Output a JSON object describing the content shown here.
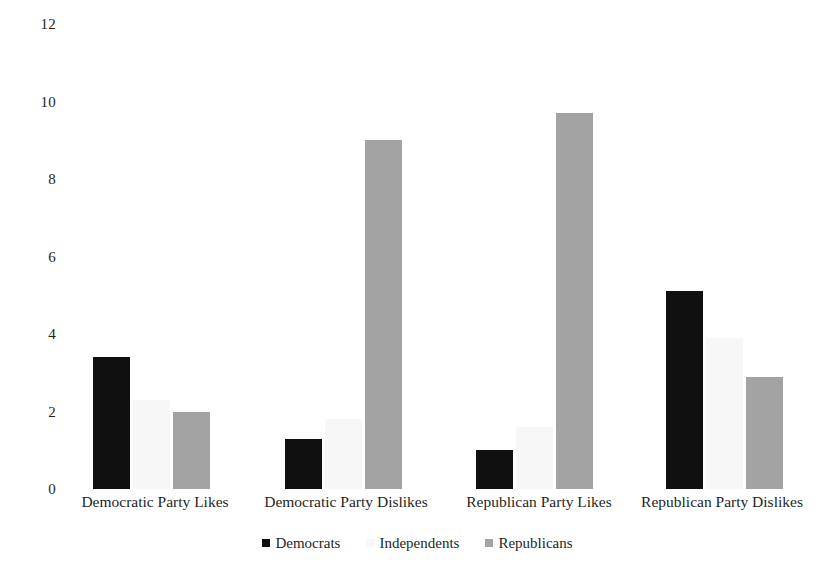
{
  "chart_data": {
    "type": "bar",
    "title": "",
    "subtitle": "",
    "xlabel": "",
    "ylabel": "",
    "ylim": [
      0,
      12
    ],
    "yticks": [
      12,
      10,
      8,
      6,
      4,
      2,
      0
    ],
    "grid": false,
    "legend_position": "bottom",
    "categories": [
      "Democratic Party Likes",
      "Democratic Party Dislikes",
      "Republican Party Likes",
      "Republican Party Dislikes"
    ],
    "series": [
      {
        "name": "Democrats",
        "color": "#101010",
        "values": [
          3.4,
          1.3,
          1.0,
          5.1
        ]
      },
      {
        "name": "Independents",
        "color": "#f7f7f7",
        "values": [
          2.3,
          1.8,
          1.6,
          3.9
        ]
      },
      {
        "name": "Republicans",
        "color": "#a3a3a3",
        "values": [
          2.0,
          9.0,
          9.7,
          2.9
        ]
      }
    ],
    "annotations": []
  },
  "axis": {
    "y_tick_labels": [
      "12",
      "10",
      "8",
      "6",
      "4",
      "2",
      "0"
    ]
  },
  "legend": {
    "items": [
      {
        "label": "Democrats",
        "swatch": "legend-swatch-democrats"
      },
      {
        "label": "Independents",
        "swatch": "legend-swatch-independents"
      },
      {
        "label": "Republicans",
        "swatch": "legend-swatch-republicans"
      }
    ]
  }
}
